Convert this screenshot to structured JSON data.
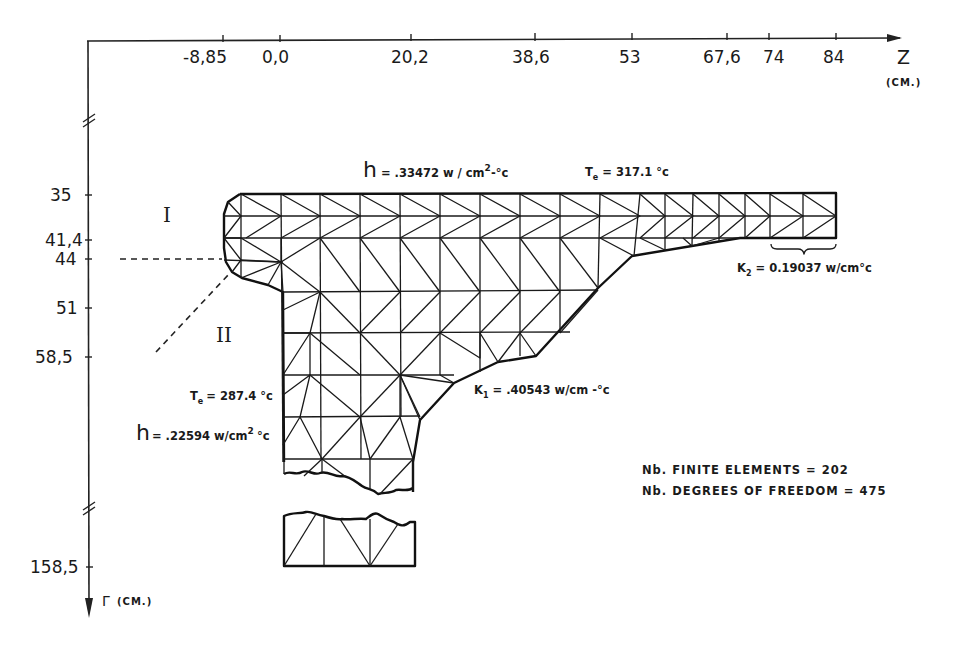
{
  "z_axis": {
    "label": "Z",
    "unit": "(CM.)",
    "ticks": [
      {
        "value": "-8,85",
        "x": 222
      },
      {
        "value": "0,0",
        "x": 280
      },
      {
        "value": "20,2",
        "x": 411
      },
      {
        "value": "38,6",
        "x": 535
      },
      {
        "value": "53",
        "x": 632
      },
      {
        "value": "67,6",
        "x": 727
      },
      {
        "value": "74",
        "x": 769
      },
      {
        "value": "84",
        "x": 836
      }
    ]
  },
  "r_axis": {
    "label": "Γ",
    "unit": "(CM.)",
    "ticks": [
      {
        "value": "35",
        "y": 195
      },
      {
        "value": "41,4",
        "y": 240
      },
      {
        "value": "44",
        "y": 259
      },
      {
        "value": "51",
        "y": 308
      },
      {
        "value": "58,5",
        "y": 356
      },
      {
        "value": "158,5",
        "y": 567
      }
    ]
  },
  "regions": {
    "region_1": "I",
    "region_2": "II"
  },
  "annotations": {
    "h_top": "h = .33472 w/cm²-°c",
    "te_top": "T̄e = 317.1 °c",
    "k2": "K₂ = 0.19037 w/cm°c",
    "k1": "K₁ = .40543 w/cm-°c",
    "te_left": "T̄e = 287.4 °c",
    "h_left": "h = .22594 w/cm² °c",
    "finite_elements": "Nb. FINITE ELEMENTS = 202",
    "degrees_of_freedom": "Nb. DEGREES OF FREEDOM = 475"
  },
  "mesh_stats": {
    "finite_elements": 202,
    "degrees_of_freedom": 475
  },
  "colors": {
    "ink": "#1a1a1a",
    "paper": "#ffffff"
  }
}
